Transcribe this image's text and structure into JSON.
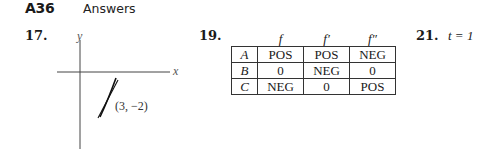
{
  "header": {
    "page_number": "A36",
    "running_head": "Answers"
  },
  "problems": {
    "p17": {
      "number": "17.",
      "graph": {
        "x_axis_label": "x",
        "y_axis_label": "y",
        "point_label": "(3, −2)",
        "point": [
          3,
          -2
        ]
      }
    },
    "p19": {
      "number": "19.",
      "table": {
        "columns": [
          "f",
          "f′",
          "f″"
        ],
        "rows": [
          {
            "label": "A",
            "values": [
              "POS",
              "POS",
              "NEG"
            ]
          },
          {
            "label": "B",
            "values": [
              "0",
              "NEG",
              "0"
            ]
          },
          {
            "label": "C",
            "values": [
              "NEG",
              "0",
              "POS"
            ]
          }
        ]
      }
    },
    "p21": {
      "number": "21.",
      "answer": "t = 1"
    }
  }
}
